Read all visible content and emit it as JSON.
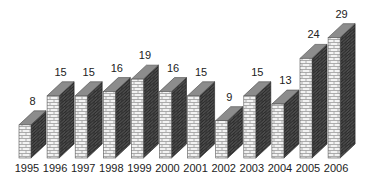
{
  "chart_data": {
    "type": "bar",
    "style": "3d-brick-columns",
    "title": "",
    "xlabel": "",
    "ylabel": "",
    "categories": [
      "1995",
      "1996",
      "1997",
      "1998",
      "1999",
      "2000",
      "2001",
      "2002",
      "2003",
      "2004",
      "2005",
      "2006"
    ],
    "values": [
      8,
      15,
      15,
      16,
      19,
      16,
      15,
      9,
      15,
      13,
      24,
      29
    ],
    "ylim": [
      0,
      30
    ],
    "grid": false,
    "legend": null,
    "data_labels": true
  },
  "colors": {
    "front_brick": "#f2f2f2",
    "front_mortar": "#9a9a9a",
    "side_brick": "#4a4a4a",
    "side_mortar": "#2a2a2a",
    "top": "#8c8c8c",
    "text": "#222222"
  }
}
